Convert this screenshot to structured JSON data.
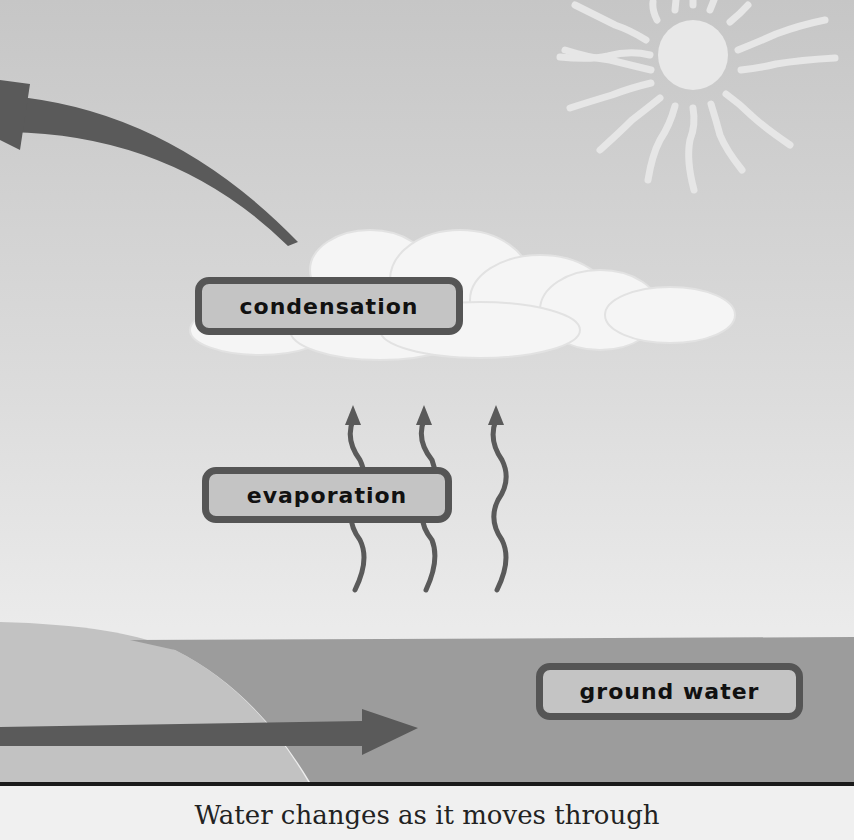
{
  "diagram": {
    "labels": {
      "condensation": "condensation",
      "evaporation": "evaporation",
      "ground_water": "ground water"
    },
    "caption": "Water changes as it moves through",
    "elements": {
      "sun": "sun-icon",
      "cloud": "cloud-icon",
      "evaporation_arrows": 3,
      "curved_arrow": "curved-arrow-up-left",
      "ground_arrow": "arrow-right"
    },
    "colors": {
      "sky_top": "#c9c9c9",
      "sky_bottom": "#ececec",
      "sun": "#e4e4e4",
      "cloud": "#f4f4f4",
      "arrow": "#5a5a5a",
      "label_fill": "#c4c4c4",
      "label_border": "#555555",
      "ground": "#9a9a9a",
      "hill": "#c2c2c2",
      "divider": "#1a1a1a"
    }
  }
}
